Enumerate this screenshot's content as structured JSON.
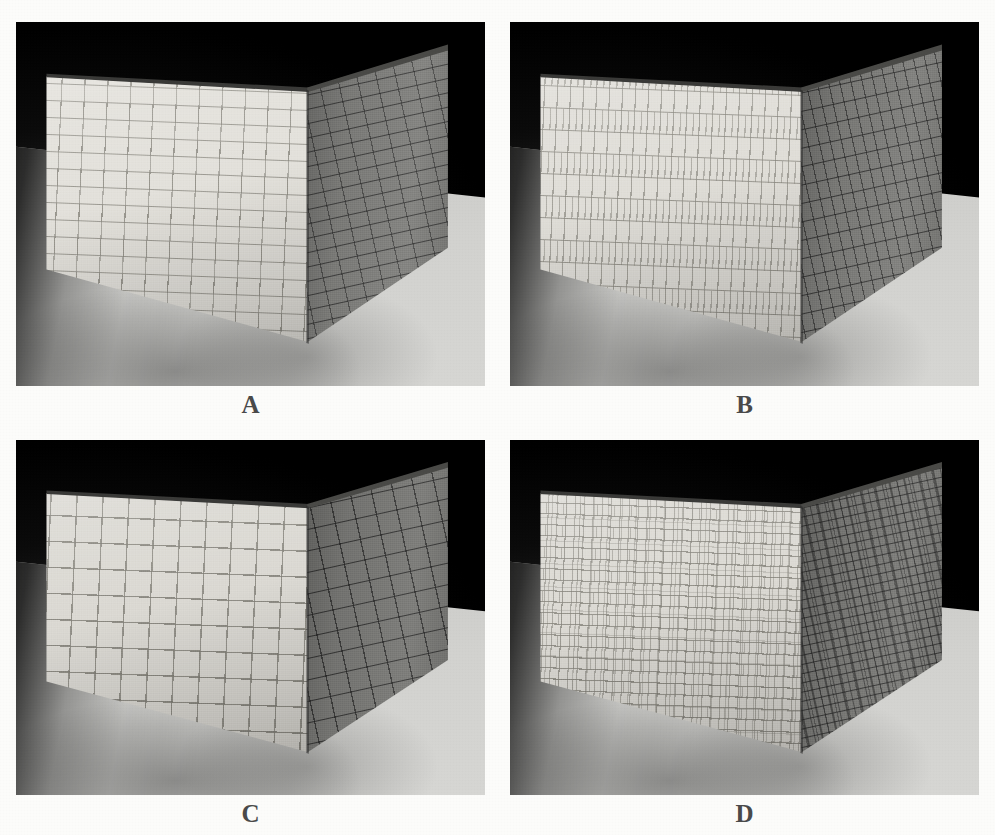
{
  "figure": {
    "kind": "four-panel-comparison",
    "layout": {
      "rows": 2,
      "columns": 2
    },
    "background_color": "#fcfcfa",
    "caption_color": "#4a4a4a"
  },
  "panels": [
    {
      "id": "A",
      "label": "A",
      "position": "top-left",
      "scene": "two brick walls meeting at a vertical corner, standing on a light gray ground plane against a black background",
      "pattern_name": "running-bond-rectangular-brick",
      "pattern_description": "Rectangular bricks wider than tall, laid in running bond with each course offset by half a brick",
      "brick_shape": "rectangular-wide",
      "offset": "half-brick running bond",
      "relative_brick_size": "large",
      "left_face_color": "#e3e1db",
      "right_face_color": "#7f7f7c",
      "mortar_color": "#8a887e",
      "floor_color": "#d2d2cf",
      "background_color": "#000000"
    },
    {
      "id": "B",
      "label": "B",
      "position": "top-right",
      "scene": "two brick walls meeting at a vertical corner, standing on a light gray ground plane against a black background",
      "pattern_name": "tall-narrow-vertical-brick",
      "pattern_description": "Narrow bricks taller than wide, stacked in offset courses giving a strongly vertical texture",
      "brick_shape": "rectangular-tall",
      "offset": "half-brick running bond",
      "relative_brick_size": "medium",
      "left_face_color": "#e0ded8",
      "right_face_color": "#7d7d7a",
      "mortar_color": "#8a8880",
      "floor_color": "#d2d2cf",
      "background_color": "#000000"
    },
    {
      "id": "C",
      "label": "C",
      "position": "bottom-left",
      "scene": "two brick walls meeting at a vertical corner, standing on a light gray ground plane against a black background",
      "pattern_name": "square-stacked-grid",
      "pattern_description": "Square tiles in a stacked bond, aligned in both rows and columns forming a regular grid",
      "brick_shape": "square",
      "offset": "none (stacked bond)",
      "relative_brick_size": "large",
      "left_face_color": "#dbd9d3",
      "right_face_color": "#787875",
      "mortar_color": "#807e76",
      "floor_color": "#d2d2cf",
      "background_color": "#000000"
    },
    {
      "id": "D",
      "label": "D",
      "position": "bottom-right",
      "scene": "two brick walls meeting at a vertical corner, standing on a light gray ground plane against a black background",
      "pattern_name": "irregular-random-small-brick",
      "pattern_description": "Small bricks of varying widths laid in irregular courses, producing a random rubble-like texture",
      "brick_shape": "irregular-mixed",
      "offset": "random",
      "relative_brick_size": "small",
      "left_face_color": "#dcdad4",
      "right_face_color": "#7a7a77",
      "mortar_color": "#84827a",
      "floor_color": "#d2d2cf",
      "background_color": "#000000"
    }
  ]
}
